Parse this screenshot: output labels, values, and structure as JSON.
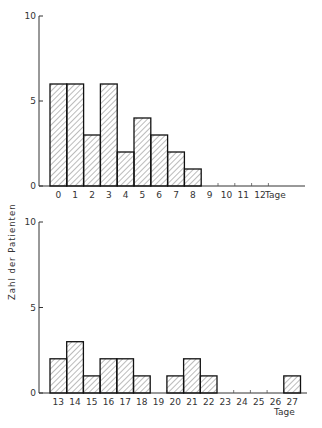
{
  "chart_data": [
    {
      "type": "bar",
      "title": "",
      "xlabel": "Tage",
      "ylabel": "Zahl der Patienten",
      "ylim": [
        0,
        10
      ],
      "yticks": [
        0,
        5,
        10
      ],
      "grid": false,
      "categories": [
        "0",
        "1",
        "2",
        "3",
        "4",
        "5",
        "6",
        "7",
        "8",
        "9",
        "10",
        "11",
        "12"
      ],
      "values": [
        6,
        6,
        3,
        6,
        2,
        4,
        3,
        2,
        1,
        0,
        0,
        0,
        0
      ]
    },
    {
      "type": "bar",
      "title": "",
      "xlabel": "Tage",
      "ylabel": "Zahl der Patienten",
      "ylim": [
        0,
        10
      ],
      "yticks": [
        0,
        5,
        10
      ],
      "grid": false,
      "categories": [
        "13",
        "14",
        "15",
        "16",
        "17",
        "18",
        "19",
        "20",
        "21",
        "22",
        "23",
        "24",
        "25",
        "26",
        "27"
      ],
      "values": [
        2,
        3,
        1,
        2,
        2,
        1,
        0,
        1,
        2,
        1,
        0,
        0,
        0,
        0,
        1
      ]
    }
  ],
  "labels": {
    "ylabel": "Zahl der Patienten",
    "xlabel": "Tage"
  }
}
